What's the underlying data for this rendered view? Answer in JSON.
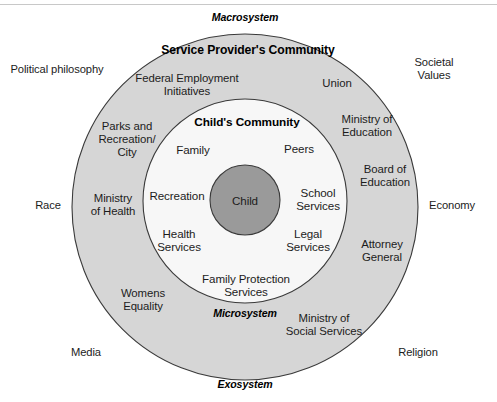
{
  "diagram": {
    "title_hidden": "Ecological Systems Model of a Child's Community",
    "colors": {
      "outer_ring_fill": "#d6d6d6",
      "inner_circle_fill": "#f7f7f7",
      "core_circle_fill": "#9a9a9a",
      "stroke": "#3a3a3a",
      "page_background": "#ffffff",
      "rule": "#c8c8c8",
      "text": "#1c1c1c"
    },
    "geometry": {
      "outer_circle": {
        "cx": 245,
        "cy": 207,
        "r": 173
      },
      "inner_circle": {
        "cx": 245,
        "cy": 201,
        "r": 102
      },
      "core_circle": {
        "cx": 245,
        "cy": 200,
        "r": 35
      }
    },
    "system_labels": [
      {
        "name": "macrosystem",
        "text": "Macrosystem",
        "x": 245,
        "y": 18
      },
      {
        "name": "microsystem",
        "text": "Microsystem",
        "x": 245,
        "y": 314
      },
      {
        "name": "exosystem",
        "text": "Exosystem",
        "x": 245,
        "y": 385
      }
    ],
    "section_titles": [
      {
        "name": "service-providers-community",
        "text": "Service Provider's Community",
        "x": 248,
        "y": 51
      },
      {
        "name": "childs-community",
        "text": "Child's Community",
        "x": 247,
        "y": 123
      }
    ],
    "core": {
      "name": "child",
      "text": "Child",
      "x": 245,
      "y": 200
    },
    "inner_nodes": [
      {
        "name": "family",
        "text": "Family",
        "x": 193,
        "y": 149
      },
      {
        "name": "peers",
        "text": "Peers",
        "x": 299,
        "y": 148
      },
      {
        "name": "recreation",
        "text": "Recreation",
        "x": 177,
        "y": 195
      },
      {
        "name": "school-services",
        "text": "School\nServices",
        "x": 318,
        "y": 199
      },
      {
        "name": "health-services",
        "text": "Health\nServices",
        "x": 179,
        "y": 240
      },
      {
        "name": "legal-services",
        "text": "Legal\nServices",
        "x": 308,
        "y": 240
      },
      {
        "name": "family-protection-services",
        "text": "Family Protection\nServices",
        "x": 246,
        "y": 285
      }
    ],
    "ring_nodes": [
      {
        "name": "federal-employment-initiatives",
        "text": "Federal Employment\nInitiatives",
        "x": 187,
        "y": 85
      },
      {
        "name": "union",
        "text": "Union",
        "x": 337,
        "y": 83
      },
      {
        "name": "parks-and-recreation-city",
        "text": "Parks and\nRecreation/\nCity",
        "x": 127,
        "y": 139
      },
      {
        "name": "ministry-of-education",
        "text": "Ministry of\nEducation",
        "x": 367,
        "y": 126
      },
      {
        "name": "board-of-education",
        "text": "Board of\nEducation",
        "x": 385,
        "y": 176
      },
      {
        "name": "ministry-of-health",
        "text": "Ministry\nof Health",
        "x": 113,
        "y": 205
      },
      {
        "name": "attorney-general",
        "text": "Attorney\nGeneral",
        "x": 382,
        "y": 251
      },
      {
        "name": "womens-equality",
        "text": "Womens\nEquality",
        "x": 143,
        "y": 300
      },
      {
        "name": "ministry-of-social-services",
        "text": "Ministry of\nSocial Services",
        "x": 324,
        "y": 325
      }
    ],
    "outside_labels": [
      {
        "name": "political-philosophy",
        "text": "Political philosophy",
        "x": 57,
        "y": 69
      },
      {
        "name": "societal-values",
        "text": "Societal Values",
        "x": 434,
        "y": 69
      },
      {
        "name": "race",
        "text": "Race",
        "x": 48,
        "y": 205
      },
      {
        "name": "economy",
        "text": "Economy",
        "x": 452,
        "y": 205
      },
      {
        "name": "media",
        "text": "Media",
        "x": 86,
        "y": 352
      },
      {
        "name": "religion",
        "text": "Religion",
        "x": 418,
        "y": 352
      }
    ]
  }
}
